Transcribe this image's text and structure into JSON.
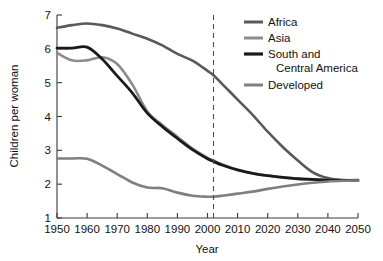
{
  "chart_data": {
    "type": "line",
    "title": "",
    "xlabel": "Year",
    "ylabel": "Children per woman",
    "xlim": [
      1950,
      2050
    ],
    "ylim": [
      1,
      7
    ],
    "xticks": [
      1950,
      1960,
      1970,
      1980,
      1990,
      2000,
      2010,
      2020,
      2030,
      2040,
      2050
    ],
    "yticks": [
      1,
      2,
      3,
      4,
      5,
      6,
      7
    ],
    "grid": false,
    "legend_position": "top-right",
    "x": [
      1950,
      1955,
      1960,
      1965,
      1970,
      1975,
      1980,
      1985,
      1990,
      1995,
      2000,
      2002,
      2005,
      2010,
      2015,
      2020,
      2025,
      2030,
      2035,
      2040,
      2045,
      2050
    ],
    "series": [
      {
        "name": "Africa",
        "color": "#595959",
        "width": 2.6,
        "values": [
          6.62,
          6.7,
          6.75,
          6.7,
          6.6,
          6.45,
          6.3,
          6.1,
          5.85,
          5.65,
          5.35,
          5.22,
          4.95,
          4.5,
          4.05,
          3.55,
          3.1,
          2.7,
          2.35,
          2.18,
          2.12,
          2.12
        ]
      },
      {
        "name": "Asia",
        "color": "#8c8c8c",
        "width": 2.6,
        "values": [
          5.88,
          5.66,
          5.66,
          5.75,
          5.55,
          4.95,
          4.15,
          3.75,
          3.4,
          3.05,
          2.78,
          2.7,
          2.58,
          2.42,
          2.32,
          2.25,
          2.2,
          2.16,
          2.13,
          2.12,
          2.11,
          2.11
        ]
      },
      {
        "name": "South and Central America",
        "color": "#1a1a1a",
        "width": 2.8,
        "values": [
          6.02,
          6.02,
          6.05,
          5.7,
          5.2,
          4.7,
          4.1,
          3.7,
          3.35,
          3.02,
          2.75,
          2.67,
          2.56,
          2.42,
          2.32,
          2.25,
          2.2,
          2.16,
          2.14,
          2.12,
          2.11,
          2.11
        ]
      },
      {
        "name": "Developed",
        "color": "#7f7f7f",
        "width": 2.6,
        "values": [
          2.76,
          2.76,
          2.75,
          2.55,
          2.3,
          2.05,
          1.9,
          1.88,
          1.75,
          1.66,
          1.63,
          1.63,
          1.66,
          1.72,
          1.78,
          1.86,
          1.93,
          1.99,
          2.04,
          2.08,
          2.1,
          2.11
        ]
      }
    ],
    "annotations": [
      {
        "name": "projection-divider",
        "type": "vline",
        "x": 2002,
        "style": "dashed",
        "color": "#4d4d4d"
      }
    ]
  },
  "legend": {
    "entries": [
      {
        "label": "Africa"
      },
      {
        "label": "Asia"
      },
      {
        "label": "South and"
      },
      {
        "label": "Central America"
      },
      {
        "label": "Developed"
      }
    ]
  },
  "axes": {
    "x_tick_labels": [
      "1950",
      "1960",
      "1970",
      "1980",
      "1990",
      "2000",
      "2010",
      "2020",
      "2030",
      "2040",
      "2050"
    ],
    "y_tick_labels": [
      "7",
      "6",
      "5",
      "4",
      "3",
      "2",
      "1"
    ],
    "x_title": "Year",
    "y_title": "Children per woman"
  }
}
